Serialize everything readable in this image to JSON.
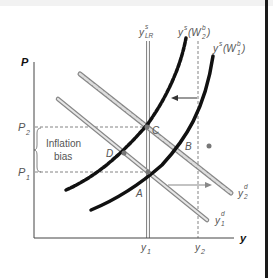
{
  "diagram": {
    "type": "economics-supply-demand",
    "axes": {
      "y_axis_label": "P",
      "x_axis_label": "y"
    },
    "price_levels": [
      {
        "label_main": "P",
        "label_sub": "2",
        "name": "P2"
      },
      {
        "label_main": "P",
        "label_sub": "1",
        "name": "P1"
      }
    ],
    "output_levels": [
      {
        "label_main": "y",
        "label_sub": "1",
        "name": "y1"
      },
      {
        "label_main": "y",
        "label_sub": "2",
        "name": "y2"
      }
    ],
    "curves": {
      "long_run_supply": {
        "main": "y",
        "sup": "s",
        "sub": "LR"
      },
      "supply_w2": {
        "main": "y",
        "sup": "s",
        "paren": "(W",
        "paren_sup": "b",
        "paren_sub": "2",
        "close": ")"
      },
      "supply_w1": {
        "main": "y",
        "sup": "s",
        "paren": "(W",
        "paren_sup": "b",
        "paren_sub": "1",
        "close": ")"
      },
      "demand_2": {
        "main": "y",
        "sup": "d",
        "sub": "2"
      },
      "demand_1": {
        "main": "y",
        "sup": "d",
        "sub": "1"
      }
    },
    "points": [
      "A",
      "B",
      "C",
      "D"
    ],
    "annotation": {
      "line1": "Inflation",
      "line2": "bias"
    },
    "colors": {
      "axis": "#555555",
      "supply_curve": "#111111",
      "demand_curve": "#9a9a9a",
      "dashed": "#555555"
    }
  }
}
